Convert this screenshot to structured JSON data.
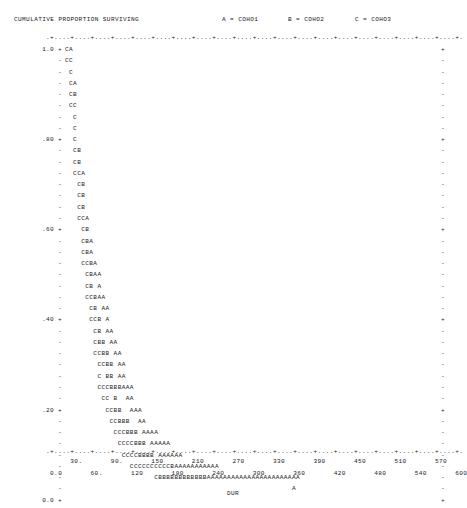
{
  "header": {
    "title": "CUMULATIVE PROPORTION SURVIVING",
    "legend": [
      {
        "symbol": "A",
        "label": "A = COHO1"
      },
      {
        "symbol": "B",
        "label": "B = COHO2"
      },
      {
        "symbol": "C",
        "label": "C = COHO3"
      }
    ]
  },
  "axes": {
    "top_rule": ".+....+....+....+....+....+....+....+....+....+....+....+....+....+....+....+....+....+....+....+....+.",
    "bottom_rule": ".+....+....+....+....+....+....+....+....+....+....+....+....+....+....+....+....+....+....+....+....+.",
    "y_title": "CUMULATIVE PROPORTION SURVIVING",
    "x_title": "DUR",
    "x_ticks_upper": "      30.       90.       150       210       270       330       390       450       510       570",
    "x_ticks_lower": " 0.0       60.       120       180       240       300       360       420       480       540       600",
    "y_tick_labels": [
      "1.0",
      ".80",
      ".60",
      ".40",
      ".20",
      "0.0"
    ],
    "x_tick_values": [
      0.0,
      30,
      60,
      90,
      120,
      150,
      180,
      210,
      240,
      270,
      300,
      330,
      360,
      390,
      420,
      450,
      480,
      510,
      540,
      570,
      600
    ]
  },
  "chart_data": {
    "type": "line",
    "title": "CUMULATIVE PROPORTION SURVIVING",
    "xlabel": "DUR",
    "ylabel": "CUMULATIVE PROPORTION SURVIVING",
    "ylim": [
      0.0,
      1.0
    ],
    "xlim": [
      0,
      600
    ],
    "grid": false,
    "legend_position": "top-right",
    "plot_style": "ascii-character-plot",
    "series": [
      {
        "name": "COHO1",
        "symbol": "A"
      },
      {
        "name": "COHO2",
        "symbol": "B"
      },
      {
        "name": "COHO3",
        "symbol": "C"
      }
    ],
    "rows": [
      {
        "ylabel": "1.0",
        "tick": "+",
        "text": "CA"
      },
      {
        "ylabel": "",
        "tick": "-",
        "text": "CC"
      },
      {
        "ylabel": "",
        "tick": "-",
        "text": " C"
      },
      {
        "ylabel": "",
        "tick": "-",
        "text": " CA"
      },
      {
        "ylabel": "",
        "tick": "-",
        "text": " CB"
      },
      {
        "ylabel": "",
        "tick": "-",
        "text": " CC"
      },
      {
        "ylabel": "",
        "tick": "-",
        "text": "  C"
      },
      {
        "ylabel": "",
        "tick": "-",
        "text": "  C"
      },
      {
        "ylabel": ".80",
        "tick": "+",
        "text": "  C"
      },
      {
        "ylabel": "",
        "tick": "-",
        "text": "  CB"
      },
      {
        "ylabel": "",
        "tick": "-",
        "text": "  CB"
      },
      {
        "ylabel": "",
        "tick": "-",
        "text": "  CCA"
      },
      {
        "ylabel": "",
        "tick": "-",
        "text": "   CB"
      },
      {
        "ylabel": "",
        "tick": "-",
        "text": "   CB"
      },
      {
        "ylabel": "",
        "tick": "-",
        "text": "   CB"
      },
      {
        "ylabel": "",
        "tick": "-",
        "text": "   CCA"
      },
      {
        "ylabel": ".60",
        "tick": "+",
        "text": "    CB"
      },
      {
        "ylabel": "",
        "tick": "-",
        "text": "    CBA"
      },
      {
        "ylabel": "",
        "tick": "-",
        "text": "    CBA"
      },
      {
        "ylabel": "",
        "tick": "-",
        "text": "    CCBA"
      },
      {
        "ylabel": "",
        "tick": "-",
        "text": "     CBAA"
      },
      {
        "ylabel": "",
        "tick": "-",
        "text": "     CB A"
      },
      {
        "ylabel": "",
        "tick": "-",
        "text": "     CCBAA"
      },
      {
        "ylabel": "",
        "tick": "-",
        "text": "      CB AA"
      },
      {
        "ylabel": ".40",
        "tick": "+",
        "text": "      CCB A"
      },
      {
        "ylabel": "",
        "tick": "-",
        "text": "       CB AA"
      },
      {
        "ylabel": "",
        "tick": "-",
        "text": "       CBB AA"
      },
      {
        "ylabel": "",
        "tick": "-",
        "text": "       CCBB AA"
      },
      {
        "ylabel": "",
        "tick": "-",
        "text": "        CCBB AA"
      },
      {
        "ylabel": "",
        "tick": "-",
        "text": "        C BB AA"
      },
      {
        "ylabel": "",
        "tick": "-",
        "text": "        CCCBBBAAA"
      },
      {
        "ylabel": "",
        "tick": "-",
        "text": "         CC B  AA"
      },
      {
        "ylabel": ".20",
        "tick": "+",
        "text": "          CCBB  AAA"
      },
      {
        "ylabel": "",
        "tick": "-",
        "text": "           CCBBB  AA"
      },
      {
        "ylabel": "",
        "tick": "-",
        "text": "            CCCBBB AAAA"
      },
      {
        "ylabel": "",
        "tick": "-",
        "text": "             CCCCBBB AAAAA"
      },
      {
        "ylabel": "",
        "tick": "-",
        "text": "              CCCCBBBB AAAAAA"
      },
      {
        "ylabel": "",
        "tick": "-",
        "text": "                CCCCCCCCCCBAAAAAAAAAAA"
      },
      {
        "ylabel": "",
        "tick": "-",
        "text": "                      CBBBBBBBBBBBBAAAAAAAAAAAAAAAAAAAAAAA"
      },
      {
        "ylabel": "",
        "tick": "-",
        "text": "                                                        A"
      },
      {
        "ylabel": "0.0",
        "tick": "+",
        "text": ""
      }
    ]
  }
}
